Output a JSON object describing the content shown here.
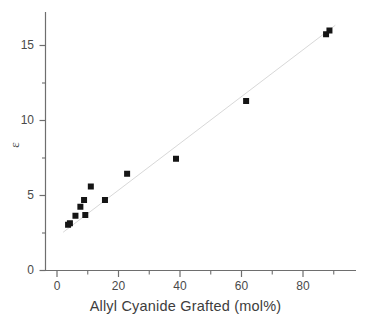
{
  "chart_data": {
    "type": "scatter",
    "title": "",
    "subtitle": "",
    "xlabel": "Allyl Cyanide Grafted (mol%)",
    "ylabel": "ε",
    "xlim": [
      -5,
      96
    ],
    "ylim": [
      0,
      17.3
    ],
    "grid": false,
    "legend": null,
    "x_major_ticks": [
      0,
      20,
      40,
      60,
      80
    ],
    "x_minor_ticks": [
      10,
      30,
      50,
      70,
      90
    ],
    "y_major_ticks": [
      0,
      5,
      10,
      15
    ],
    "y_minor_ticks": [
      2.5,
      7.5,
      12.5
    ],
    "x_tick_labels": [
      "0",
      "20",
      "40",
      "60",
      "80"
    ],
    "y_tick_labels": [
      "0",
      "5",
      "10",
      "15"
    ],
    "marker": {
      "shape": "square",
      "color": "#151515",
      "size_px": 6
    },
    "series": [
      {
        "name": "Dielectric constant vs grafting",
        "points": [
          {
            "x": 3.6,
            "y": 3.05
          },
          {
            "x": 4.2,
            "y": 3.15
          },
          {
            "x": 6.0,
            "y": 3.65
          },
          {
            "x": 7.6,
            "y": 4.25
          },
          {
            "x": 8.8,
            "y": 4.7
          },
          {
            "x": 9.2,
            "y": 3.7
          },
          {
            "x": 11.0,
            "y": 5.6
          },
          {
            "x": 15.6,
            "y": 4.7
          },
          {
            "x": 22.8,
            "y": 6.45
          },
          {
            "x": 38.7,
            "y": 7.45
          },
          {
            "x": 61.5,
            "y": 11.3
          },
          {
            "x": 87.5,
            "y": 15.75
          },
          {
            "x": 88.6,
            "y": 16.0
          }
        ]
      }
    ],
    "fit_line": {
      "style": "solid",
      "color": "#d8d8d8",
      "width_px": 1,
      "x_start": 2.0,
      "y_start": 2.55,
      "x_end": 90.5,
      "y_end": 16.35
    }
  },
  "axes": {
    "x_axis_name": "x-axis",
    "y_axis_name": "y-axis",
    "axis_color": "#6e6e6e"
  }
}
